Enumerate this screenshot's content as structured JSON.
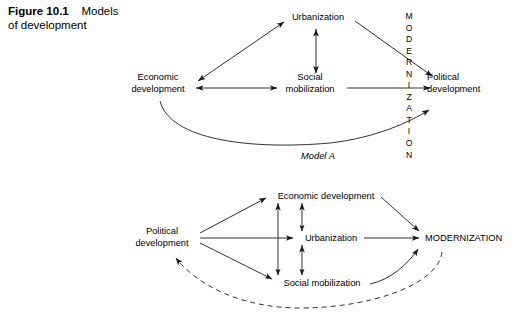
{
  "figure": {
    "number": "Figure 10.1",
    "title": "Models of development",
    "title_line1": "Models",
    "title_line2": "of development"
  },
  "diagram": {
    "type": "flow-diagram",
    "stroke_color": "#1a1a1a",
    "background_color": "#ffffff",
    "models": [
      {
        "id": "model-a",
        "caption": "Model A",
        "nodes": [
          {
            "id": "a-economic-development",
            "label": "Economic\ndevelopment",
            "line1": "Economic",
            "line2": "development",
            "x": 158,
            "y": 88
          },
          {
            "id": "a-urbanization",
            "label": "Urbanization",
            "x": 318,
            "y": 18
          },
          {
            "id": "a-social-mobilization",
            "label": "Social\nmobilization",
            "line1": "Social",
            "line2": "mobilization",
            "x": 310,
            "y": 88
          },
          {
            "id": "a-modernization",
            "label": "MODERNIZATION",
            "orientation": "vertical",
            "letters": [
              "M",
              "O",
              "D",
              "E",
              "R",
              "N",
              "I",
              "Z",
              "A",
              "T",
              "I",
              "O",
              "N"
            ],
            "x": 409,
            "y": 82
          },
          {
            "id": "a-political-development",
            "label": "Political\ndevelopment",
            "line1": "Political",
            "line2": "development",
            "x": 467,
            "y": 88
          }
        ],
        "edges": [
          {
            "from": "a-economic-development",
            "to": "a-urbanization",
            "style": "solid",
            "heads": "both"
          },
          {
            "from": "a-economic-development",
            "to": "a-social-mobilization",
            "style": "solid",
            "heads": "both"
          },
          {
            "from": "a-urbanization",
            "to": "a-social-mobilization",
            "style": "solid",
            "heads": "both"
          },
          {
            "from": "a-urbanization",
            "to": "a-political-development",
            "style": "solid",
            "heads": "end"
          },
          {
            "from": "a-social-mobilization",
            "to": "a-political-development",
            "style": "solid",
            "heads": "end"
          },
          {
            "from": "a-economic-development",
            "to": "a-political-development",
            "style": "solid-curved",
            "heads": "end"
          }
        ]
      },
      {
        "id": "model-b",
        "caption": "",
        "nodes": [
          {
            "id": "b-political-development",
            "label": "Political\ndevelopment",
            "line1": "Political",
            "line2": "development",
            "x": 162,
            "y": 238
          },
          {
            "id": "b-economic-development",
            "label": "Economic development",
            "x": 340,
            "y": 196
          },
          {
            "id": "b-urbanization",
            "label": "Urbanization",
            "x": 330,
            "y": 238
          },
          {
            "id": "b-social-mobilization",
            "label": "Social mobilization",
            "x": 335,
            "y": 283
          },
          {
            "id": "b-modernization",
            "label": "MODERNIZATION",
            "orientation": "horizontal",
            "x": 468,
            "y": 238
          }
        ],
        "edges": [
          {
            "from": "b-political-development",
            "to": "b-economic-development",
            "style": "solid",
            "heads": "end"
          },
          {
            "from": "b-political-development",
            "to": "b-urbanization",
            "style": "solid",
            "heads": "end"
          },
          {
            "from": "b-political-development",
            "to": "b-social-mobilization",
            "style": "solid",
            "heads": "end"
          },
          {
            "from": "b-economic-development",
            "to": "b-social-mobilization",
            "style": "solid",
            "heads": "both"
          },
          {
            "from": "b-economic-development",
            "to": "b-urbanization",
            "style": "solid",
            "heads": "both"
          },
          {
            "from": "b-urbanization",
            "to": "b-social-mobilization",
            "style": "solid",
            "heads": "both"
          },
          {
            "from": "b-economic-development",
            "to": "b-modernization",
            "style": "solid",
            "heads": "end"
          },
          {
            "from": "b-urbanization",
            "to": "b-modernization",
            "style": "solid",
            "heads": "end"
          },
          {
            "from": "b-social-mobilization",
            "to": "b-modernization",
            "style": "solid-curved",
            "heads": "end"
          },
          {
            "from": "b-modernization",
            "to": "b-political-development",
            "style": "dashed-curved",
            "heads": "end"
          }
        ]
      }
    ]
  }
}
